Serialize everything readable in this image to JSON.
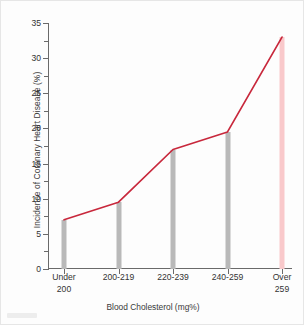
{
  "chart_data": {
    "type": "line",
    "title": "",
    "xlabel": "Blood Cholesterol (mg%)",
    "ylabel": "Incidence of Coronary Heart Disease (%)",
    "categories": [
      "Under 200",
      "200-219",
      "220-239",
      "240-259",
      "Over 259"
    ],
    "category_lines": [
      [
        "Under",
        "200"
      ],
      [
        "200-219",
        ""
      ],
      [
        "220-239",
        ""
      ],
      [
        "240-259",
        ""
      ],
      [
        "Over",
        "259"
      ]
    ],
    "values": [
      7,
      9.5,
      17,
      19.5,
      33
    ],
    "ylim": [
      0,
      35
    ],
    "ytick_values": [
      0,
      5,
      10,
      15,
      20,
      25,
      30,
      35
    ],
    "ytick_labels": [
      "0",
      "5",
      "10",
      "15",
      "20",
      "25",
      "30",
      "35"
    ],
    "yminor_values": [
      2.5,
      7.5,
      12.5,
      17.5,
      22.5,
      27.5,
      32.5
    ],
    "grid": false,
    "legend": false,
    "legend_position": "none",
    "series": [
      {
        "name": "Incidence of Coronary Heart Disease (%)",
        "values": [
          7,
          9.5,
          17,
          19.5,
          33
        ]
      }
    ],
    "bar_colors": [
      "#b9b9b9",
      "#b9b9b9",
      "#b9b9b9",
      "#b9b9b9",
      "#f9c9cb"
    ],
    "line_color": "#c8283c",
    "axis_color": "#6a6a6a",
    "text_color": "#333333",
    "background_color": "#fdfdfd"
  }
}
